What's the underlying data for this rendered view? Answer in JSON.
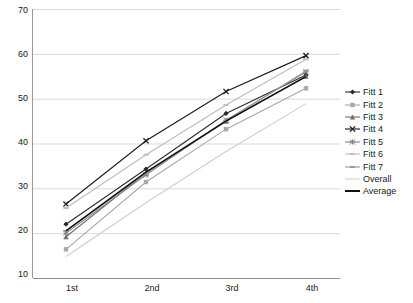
{
  "chart_data": {
    "type": "line",
    "title": "",
    "xlabel": "",
    "ylabel": "",
    "categories": [
      "1st",
      "2nd",
      "3rd",
      "4th"
    ],
    "ylim": [
      10,
      70
    ],
    "yticks": [
      10,
      20,
      30,
      40,
      50,
      60,
      70
    ],
    "grid": true,
    "legend_position": "right",
    "series": [
      {
        "name": "Fitt 1",
        "values": [
          22.0,
          34.3,
          46.7,
          55.3
        ],
        "color": "#2b2b2b",
        "marker": "diamond"
      },
      {
        "name": "Fitt 2",
        "values": [
          16.4,
          31.4,
          43.2,
          52.3
        ],
        "color": "#a8a8a8",
        "marker": "square"
      },
      {
        "name": "Fitt 3",
        "values": [
          19.2,
          33.4,
          45.0,
          55.0
        ],
        "color": "#6e6e6e",
        "marker": "triangle"
      },
      {
        "name": "Fitt 4",
        "values": [
          26.5,
          40.6,
          51.6,
          59.6
        ],
        "color": "#1a1a1a",
        "marker": "x"
      },
      {
        "name": "Fitt 5",
        "values": [
          20.0,
          33.0,
          45.2,
          56.0
        ],
        "color": "#808080",
        "marker": "star"
      },
      {
        "name": "Fitt 6",
        "values": [
          25.6,
          37.5,
          48.6,
          58.8
        ],
        "color": "#bdbdbd",
        "marker": "dash"
      },
      {
        "name": "Fitt 7",
        "values": [
          20.5,
          33.3,
          45.0,
          56.2
        ],
        "color": "#9a9a9a",
        "marker": "dash"
      },
      {
        "name": "Overall",
        "values": [
          14.8,
          26.8,
          38.2,
          48.9
        ],
        "color": "#cfcfcf",
        "marker": "none"
      },
      {
        "name": "Average",
        "values": [
          20.5,
          33.6,
          45.0,
          54.9
        ],
        "color": "#111111",
        "marker": "none"
      }
    ]
  },
  "legend": {
    "entries": [
      {
        "label": "Fitt 1"
      },
      {
        "label": "Fitt 2"
      },
      {
        "label": "Fitt 3"
      },
      {
        "label": "Fitt 4"
      },
      {
        "label": "Fitt 5"
      },
      {
        "label": "Fitt 6"
      },
      {
        "label": "Fitt 7"
      },
      {
        "label": "Overall"
      },
      {
        "label": "Average"
      }
    ]
  },
  "axes": {
    "y_tick_labels": [
      "70",
      "60",
      "50",
      "40",
      "30",
      "20",
      "10"
    ],
    "x_tick_labels": [
      "1st",
      "2nd",
      "3rd",
      "4th"
    ]
  }
}
